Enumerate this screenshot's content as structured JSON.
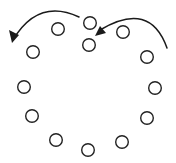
{
  "diagram": {
    "type": "ring-of-nodes-with-arrows",
    "width": 176,
    "height": 163,
    "background": "#ffffff",
    "stroke_color": "#222222",
    "node_radius": 6.3,
    "nodes": [
      {
        "id": "n1",
        "cx": 90,
        "cy": 23
      },
      {
        "id": "n2",
        "cx": 89,
        "cy": 45
      },
      {
        "id": "n3",
        "cx": 58,
        "cy": 29
      },
      {
        "id": "n4",
        "cx": 33,
        "cy": 52
      },
      {
        "id": "n5",
        "cx": 24,
        "cy": 87
      },
      {
        "id": "n6",
        "cx": 32,
        "cy": 116
      },
      {
        "id": "n7",
        "cx": 56,
        "cy": 140
      },
      {
        "id": "n8",
        "cx": 88,
        "cy": 150
      },
      {
        "id": "n9",
        "cx": 122,
        "cy": 142
      },
      {
        "id": "n10",
        "cx": 147,
        "cy": 118
      },
      {
        "id": "n11",
        "cx": 155,
        "cy": 88
      },
      {
        "id": "n12",
        "cx": 147,
        "cy": 57
      },
      {
        "id": "n13",
        "cx": 123,
        "cy": 32
      }
    ],
    "arrows": [
      {
        "id": "arrow-left",
        "direction": "counter-clockwise, pointing down-left",
        "path": "M 79 17 Q 38 -2 13 40",
        "head": "12,43 9,30 19,35"
      },
      {
        "id": "arrow-right",
        "direction": "counter-clockwise, pointing down-left toward center node",
        "path": "M 167 48 Q 150 0 100 30",
        "head": "95,36 100,26 106,33"
      }
    ]
  }
}
